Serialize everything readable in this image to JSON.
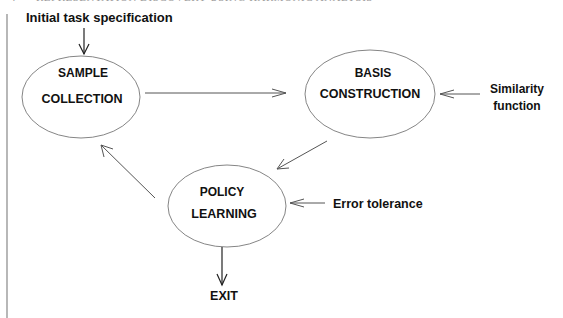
{
  "running_head": {
    "page_number": "4",
    "title": "REPRESENTATION DISCOVERY USING HARMONIC ANALYSIS"
  },
  "diagram": {
    "inputs": {
      "initial": "Initial task specification",
      "similarity_line1": "Similarity",
      "similarity_line2": "function",
      "error": "Error tolerance"
    },
    "nodes": {
      "sample": {
        "line1": "SAMPLE",
        "line2": "COLLECTION"
      },
      "basis": {
        "line1": "BASIS",
        "line2": "CONSTRUCTION"
      },
      "policy": {
        "line1": "POLICY",
        "line2": "LEARNING"
      }
    },
    "exit": "EXIT",
    "colors": {
      "text": "#111111",
      "ellipse_stroke": "#777777",
      "arrow_stroke": "#555555",
      "margin_rule": "#888888"
    }
  }
}
